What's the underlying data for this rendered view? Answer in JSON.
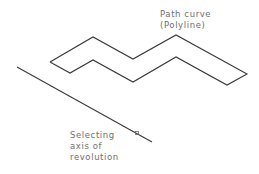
{
  "diagram": {
    "background": "#ffffff",
    "stroke_color": "#3a3a3a",
    "text_color": "#6f6f6f",
    "path_label": {
      "lines": [
        "Path curve",
        "(Polyline)"
      ]
    },
    "axis_label": {
      "lines": [
        "Selecting",
        "axis of",
        "revolution"
      ]
    },
    "polyline": {
      "points": [
        [
          50,
          62
        ],
        [
          93,
          37
        ],
        [
          133,
          59
        ],
        [
          176,
          35
        ],
        [
          247,
          74
        ],
        [
          227,
          85
        ],
        [
          176,
          57
        ],
        [
          133,
          82
        ],
        [
          93,
          60
        ],
        [
          70,
          73
        ],
        [
          50,
          62
        ]
      ]
    },
    "axis_line": {
      "start": [
        17,
        67
      ],
      "end": [
        152,
        142
      ]
    },
    "pick_marker": {
      "center": [
        137,
        133
      ],
      "size": 3
    }
  }
}
